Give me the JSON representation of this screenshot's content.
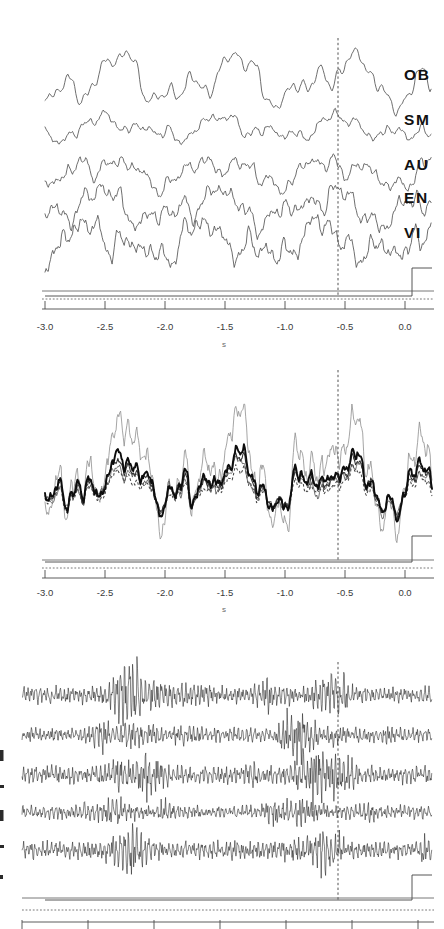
{
  "figure": {
    "type": "multi-panel-timeseries",
    "background": "#ffffff",
    "ink": "#1a1a1a",
    "width": 444,
    "height": 929,
    "panel_count": 3
  },
  "axis": {
    "xlabel": "s",
    "xlim": [
      -3.15,
      0.12
    ],
    "ticks": [
      -3.0,
      -2.5,
      -2.0,
      -1.5,
      -1.0,
      -0.5,
      0.0
    ],
    "tick_labels": [
      "-3.0",
      "-2.5",
      "-2.0",
      "-1.5",
      "-1.0",
      "-0.5",
      "0.0"
    ],
    "grid": false,
    "tick_direction": "up"
  },
  "event_marker": {
    "label": "",
    "time_s": -0.56,
    "style": "dashed-vertical"
  },
  "trigger": {
    "label": "",
    "onset_s": -0.03,
    "style": "step"
  },
  "panels": [
    {
      "id": "panel-top",
      "name": "envelope-traces",
      "channel_labels": [
        "OB",
        "SM",
        "AU",
        "EN",
        "VI"
      ],
      "line_style": "thin-solid",
      "trace_count": 5
    },
    {
      "id": "panel-mid",
      "name": "overlay-traces",
      "channel_labels": [],
      "line_style": "mixed",
      "trace_count": 5,
      "styles": [
        "thick-solid",
        "mid-solid",
        "light-solid",
        "dotted",
        "thin-solid"
      ]
    },
    {
      "id": "panel-bot",
      "name": "raw-traces",
      "channel_labels": [],
      "line_style": "thin-raw",
      "trace_count": 5,
      "clipped": true
    }
  ],
  "chart_data": {
    "type": "line",
    "title": "",
    "xlabel": "s",
    "ylabel": "",
    "xlim": [
      -3.15,
      0.12
    ],
    "xticks": [
      -3.0,
      -2.5,
      -2.0,
      -1.5,
      -1.0,
      -0.5,
      0.0
    ],
    "xtick_labels": [
      "-3.0",
      "-2.5",
      "-2.0",
      "-1.5",
      "-1.0",
      "-0.5",
      "0.0"
    ],
    "grid": false,
    "legend": "none",
    "annotations": [
      {
        "type": "vline",
        "x": -0.56,
        "style": "dashed"
      },
      {
        "type": "step",
        "x": -0.03,
        "style": "trigger"
      }
    ],
    "series": [
      {
        "name": "OB",
        "panel": "panel-top",
        "style": "thin-solid",
        "baseline": 80,
        "amplitude": 34
      },
      {
        "name": "SM",
        "panel": "panel-top",
        "style": "thin-solid",
        "baseline": 128,
        "amplitude": 16
      },
      {
        "name": "AU",
        "panel": "panel-top",
        "style": "thin-solid",
        "baseline": 172,
        "amplitude": 20
      },
      {
        "name": "EN",
        "panel": "panel-top",
        "style": "thin-solid",
        "baseline": 207,
        "amplitude": 24
      },
      {
        "name": "VI",
        "panel": "panel-top",
        "style": "thin-solid",
        "baseline": 242,
        "amplitude": 26
      },
      {
        "name": "overlay-1",
        "panel": "panel-mid",
        "style": "thick-solid"
      },
      {
        "name": "overlay-2",
        "panel": "panel-mid",
        "style": "mid-solid"
      },
      {
        "name": "overlay-3",
        "panel": "panel-mid",
        "style": "light-solid"
      },
      {
        "name": "overlay-4",
        "panel": "panel-mid",
        "style": "dotted"
      },
      {
        "name": "overlay-5",
        "panel": "panel-mid",
        "style": "thin-solid"
      },
      {
        "name": "raw-1",
        "panel": "panel-bot",
        "style": "thin-raw"
      },
      {
        "name": "raw-2",
        "panel": "panel-bot",
        "style": "thin-raw"
      },
      {
        "name": "raw-3",
        "panel": "panel-bot",
        "style": "thin-raw"
      },
      {
        "name": "raw-4",
        "panel": "panel-bot",
        "style": "thin-raw"
      },
      {
        "name": "raw-5",
        "panel": "panel-bot",
        "style": "thin-raw"
      }
    ]
  }
}
